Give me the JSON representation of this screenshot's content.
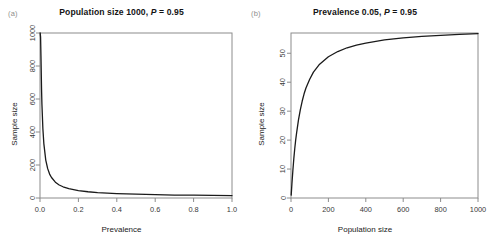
{
  "figure": {
    "background": "#ffffff",
    "axis_color": "#8c8c8c",
    "curve_color": "#1a1a1a"
  },
  "panels": [
    {
      "tag": "(a)",
      "title_prefix": "Population size 1000, ",
      "title_italic": "P",
      "title_suffix": " = 0.95"
    },
    {
      "tag": "(b)",
      "title_prefix": "Prevalence 0.05, ",
      "title_italic": "P",
      "title_suffix": " = 0.95"
    }
  ],
  "chart_data": [
    {
      "type": "line",
      "title": "Population size 1000, P = 0.95",
      "panel": "(a)",
      "xlabel": "Prevalence",
      "ylabel": "Sample size",
      "xlim": [
        0,
        1.0
      ],
      "ylim": [
        0,
        1000
      ],
      "xticks": [
        0.0,
        0.2,
        0.4,
        0.6,
        0.8,
        1.0
      ],
      "xticklabels": [
        "0.0",
        "0.2",
        "0.4",
        "0.6",
        "0.8",
        "1.0"
      ],
      "yticks": [
        0,
        200,
        400,
        600,
        800,
        1000
      ],
      "yticklabels": [
        "0",
        "200",
        "400",
        "600",
        "800",
        "1000"
      ],
      "grid": false,
      "legend": false,
      "x": [
        0.001,
        0.003,
        0.005,
        0.008,
        0.01,
        0.015,
        0.02,
        0.03,
        0.04,
        0.05,
        0.06,
        0.08,
        0.1,
        0.12,
        0.15,
        0.2,
        0.25,
        0.3,
        0.35,
        0.4,
        0.5,
        0.6,
        0.7,
        0.8,
        0.9,
        1.0
      ],
      "y": [
        1000,
        975,
        860,
        660,
        570,
        420,
        330,
        230,
        178,
        145,
        124,
        96,
        79,
        68,
        57,
        45,
        38,
        33,
        30,
        27,
        23,
        20,
        18,
        17,
        16,
        15
      ],
      "curve_note": "Sharp hyperbolic decay from 1000 at near-zero prevalence to a low flat tail"
    },
    {
      "type": "line",
      "title": "Prevalence 0.05, P = 0.95",
      "panel": "(b)",
      "xlabel": "Population size",
      "ylabel": "Sample size",
      "xlim": [
        0,
        1000
      ],
      "ylim": [
        0,
        57
      ],
      "xticks": [
        0,
        200,
        400,
        600,
        800,
        1000
      ],
      "xticklabels": [
        "0",
        "200",
        "400",
        "600",
        "800",
        "1000"
      ],
      "yticks": [
        0,
        10,
        20,
        30,
        40,
        50
      ],
      "yticklabels": [
        "0",
        "10",
        "20",
        "30",
        "40",
        "50"
      ],
      "grid": false,
      "legend": false,
      "x": [
        1,
        5,
        10,
        15,
        20,
        25,
        30,
        40,
        50,
        60,
        70,
        80,
        100,
        120,
        150,
        200,
        250,
        300,
        350,
        400,
        500,
        600,
        700,
        800,
        900,
        1000
      ],
      "y": [
        1,
        5,
        9.5,
        13.5,
        17,
        20,
        22.5,
        27,
        30.5,
        33.5,
        36,
        38,
        41,
        43.5,
        46,
        48.8,
        50.6,
        51.9,
        52.8,
        53.5,
        54.6,
        55.3,
        55.8,
        56.2,
        56.5,
        56.8
      ],
      "curve_note": "Saturating rise from 0 toward asymptote near 57"
    }
  ]
}
